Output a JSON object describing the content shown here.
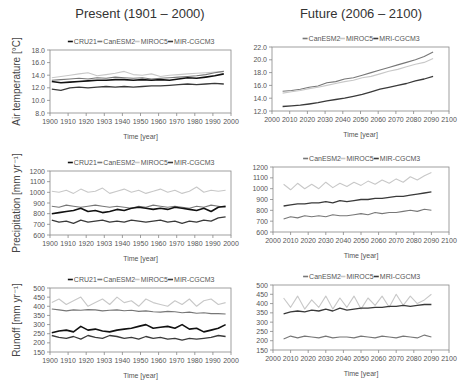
{
  "columns": {
    "left_title": "Present (1901 – 2000)",
    "right_title": "Future (2006 – 2100)"
  },
  "series_styles": {
    "CRU21": {
      "color": "#111111",
      "width": 1.6
    },
    "CanESM2": {
      "color": "#777777",
      "width": 1.1
    },
    "MIROC5": {
      "color": "#c8c8c8",
      "width": 1.1
    },
    "MIR-CGCM3": {
      "color": "#3a3a3a",
      "width": 1.3
    },
    "MRI-CGCM3": {
      "color": "#3a3a3a",
      "width": 1.3
    }
  },
  "chart_data": [
    {
      "id": "temp-present",
      "type": "line",
      "title": "",
      "ylabel": "Air temperature [°C]",
      "xlabel": "Time [year]",
      "box": {
        "x0": 50,
        "x1": 231,
        "y0": 50,
        "y1": 113
      },
      "xlim": [
        1900,
        2000
      ],
      "ylim": [
        8,
        18
      ],
      "xticks": [
        1900,
        1910,
        1920,
        1930,
        1940,
        1950,
        1960,
        1970,
        1980,
        1990,
        2000
      ],
      "xtick_labels": [
        "1900",
        "1910",
        "1920",
        "1903",
        "1940",
        "1950",
        "1960",
        "1970",
        "1980",
        "1990",
        "2000"
      ],
      "yticks": [
        8,
        10,
        12,
        14,
        16,
        18
      ],
      "ytick_labels": [
        "8.0",
        "10.0",
        "12.0",
        "14.0",
        "16.0",
        "18.0"
      ],
      "legend": [
        "CRU21",
        "CanESM2",
        "MIROC5",
        "MIR-CGCM3"
      ],
      "series": [
        {
          "name": "MIROC5",
          "x_start": 1901,
          "x_step": 5,
          "values": [
            13.6,
            13.8,
            14.0,
            14.2,
            14.4,
            13.9,
            14.1,
            14.3,
            14.6,
            14.1,
            14.0,
            14.2,
            13.8,
            14.0,
            14.1,
            14.2,
            14.3,
            14.4,
            14.5,
            14.6
          ]
        },
        {
          "name": "CanESM2",
          "x_start": 1901,
          "x_step": 5,
          "values": [
            13.2,
            13.3,
            13.4,
            13.5,
            13.4,
            13.6,
            13.5,
            13.7,
            13.6,
            13.5,
            13.6,
            13.4,
            13.5,
            13.6,
            13.7,
            13.8,
            13.9,
            14.1,
            14.4,
            14.6
          ]
        },
        {
          "name": "CRU21",
          "x_start": 1901,
          "x_step": 5,
          "values": [
            13.0,
            12.8,
            12.9,
            13.0,
            13.1,
            13.2,
            13.2,
            13.3,
            13.3,
            13.2,
            13.3,
            13.2,
            13.3,
            13.2,
            13.4,
            13.6,
            13.5,
            13.7,
            13.9,
            14.2
          ]
        },
        {
          "name": "MIR-CGCM3",
          "x_start": 1901,
          "x_step": 5,
          "values": [
            11.8,
            11.6,
            12.0,
            12.1,
            12.0,
            12.1,
            12.2,
            12.1,
            12.2,
            12.1,
            12.2,
            12.3,
            12.3,
            12.4,
            12.5,
            12.6,
            12.5,
            12.6,
            12.7,
            12.6
          ]
        }
      ]
    },
    {
      "id": "temp-future",
      "type": "line",
      "title": "",
      "ylabel": "",
      "xlabel": "Time [year]",
      "box": {
        "x0": 272,
        "x1": 449,
        "y0": 47,
        "y1": 111
      },
      "xlim": [
        2000,
        2100
      ],
      "ylim": [
        12,
        22
      ],
      "xticks": [
        2000,
        2010,
        2020,
        2030,
        2040,
        2050,
        2060,
        2070,
        2080,
        2090,
        2100
      ],
      "xtick_labels": [
        "2000",
        "2010",
        "2020",
        "2030",
        "2040",
        "2050",
        "2060",
        "2070",
        "2080",
        "2090",
        "2100"
      ],
      "yticks": [
        12,
        14,
        16,
        18,
        20,
        22
      ],
      "ytick_labels": [
        "12.0",
        "14.0",
        "16.0",
        "18.0",
        "20.0",
        "22.0"
      ],
      "legend": [
        "CanESM2",
        "MIROC5",
        "MRI-CGCM3"
      ],
      "series": [
        {
          "name": "CanESM2",
          "x_start": 2006,
          "x_step": 5,
          "values": [
            15.1,
            15.2,
            15.4,
            15.7,
            15.9,
            16.4,
            16.6,
            17.0,
            17.2,
            17.6,
            18.0,
            18.4,
            18.8,
            19.2,
            19.6,
            20.0,
            20.5,
            21.2
          ]
        },
        {
          "name": "MIROC5",
          "x_start": 2006,
          "x_step": 5,
          "values": [
            14.8,
            15.0,
            15.2,
            15.5,
            15.7,
            16.0,
            16.3,
            16.6,
            16.8,
            17.2,
            17.4,
            17.8,
            18.2,
            18.5,
            18.9,
            19.3,
            19.6,
            20.2
          ]
        },
        {
          "name": "MRI-CGCM3",
          "x_start": 2006,
          "x_step": 5,
          "values": [
            12.7,
            12.8,
            12.9,
            13.1,
            13.3,
            13.6,
            13.8,
            14.0,
            14.3,
            14.6,
            15.0,
            15.4,
            15.7,
            16.0,
            16.3,
            16.7,
            17.0,
            17.4
          ]
        }
      ]
    },
    {
      "id": "precip-present",
      "type": "line",
      "title": "",
      "ylabel": "Precipitation [mm yr⁻¹]",
      "xlabel": "Time [year]",
      "box": {
        "x0": 50,
        "x1": 231,
        "y0": 171,
        "y1": 235
      },
      "xlim": [
        1900,
        2000
      ],
      "ylim": [
        600,
        1200
      ],
      "xticks": [
        1900,
        1910,
        1920,
        1930,
        1940,
        1950,
        1960,
        1970,
        1980,
        1990,
        2000
      ],
      "xtick_labels": [
        "1900",
        "1910",
        "1920",
        "1903",
        "1940",
        "1950",
        "1960",
        "1970",
        "1980",
        "1990",
        "2000"
      ],
      "yticks": [
        600,
        700,
        800,
        900,
        1000,
        1100,
        1200
      ],
      "ytick_labels": [
        "600",
        "700",
        "800",
        "900",
        "1000",
        "1100",
        "1200"
      ],
      "legend": [
        "CRU21",
        "CanESM2",
        "MIROC5",
        "MIR-CGCM3"
      ],
      "series": [
        {
          "name": "MIROC5",
          "x_start": 1901,
          "x_step": 4,
          "values": [
            1010,
            1000,
            1020,
            990,
            1030,
            1000,
            1010,
            1040,
            990,
            1010,
            1030,
            1000,
            1020,
            990,
            1010,
            1030,
            1000,
            1020,
            990,
            1010,
            1050,
            1000,
            1020,
            1010,
            1020
          ]
        },
        {
          "name": "CanESM2",
          "x_start": 1901,
          "x_step": 4,
          "values": [
            870,
            860,
            880,
            870,
            860,
            870,
            880,
            870,
            860,
            870,
            860,
            850,
            870,
            860,
            880,
            870,
            860,
            870,
            860,
            850,
            870,
            860,
            880,
            870,
            860
          ]
        },
        {
          "name": "CRU21",
          "x_start": 1901,
          "x_step": 4,
          "values": [
            800,
            810,
            820,
            830,
            850,
            820,
            830,
            810,
            820,
            840,
            830,
            850,
            860,
            850,
            840,
            850,
            840,
            860,
            850,
            840,
            830,
            850,
            820,
            860,
            870
          ]
        },
        {
          "name": "MIR-CGCM3",
          "x_start": 1901,
          "x_step": 4,
          "values": [
            740,
            720,
            730,
            710,
            740,
            720,
            730,
            740,
            720,
            730,
            720,
            740,
            730,
            720,
            730,
            740,
            720,
            730,
            710,
            730,
            720,
            740,
            730,
            760,
            770
          ]
        }
      ]
    },
    {
      "id": "precip-future",
      "type": "line",
      "title": "",
      "ylabel": "",
      "xlabel": "Time [year]",
      "box": {
        "x0": 273,
        "x1": 449,
        "y0": 167,
        "y1": 232
      },
      "xlim": [
        2000,
        2100
      ],
      "ylim": [
        600,
        1200
      ],
      "xticks": [
        2000,
        2010,
        2020,
        2030,
        2040,
        2050,
        2060,
        2070,
        2080,
        2090,
        2100
      ],
      "xtick_labels": [
        "2000",
        "2010",
        "2020",
        "2030",
        "2040",
        "2050",
        "2060",
        "2070",
        "2080",
        "2090",
        "2100"
      ],
      "yticks": [
        600,
        700,
        800,
        900,
        1000,
        1100,
        1200
      ],
      "ytick_labels": [
        "600",
        "700",
        "800",
        "900",
        "1000",
        "1100",
        "1200"
      ],
      "legend": [
        "CanESM2",
        "MIROC5",
        "MIR-CGCM3"
      ],
      "series": [
        {
          "name": "MIROC5",
          "x_start": 2006,
          "x_step": 4,
          "values": [
            1040,
            990,
            1050,
            1000,
            1040,
            1000,
            1060,
            1010,
            1050,
            1020,
            1060,
            1030,
            1070,
            1040,
            1080,
            1050,
            1090,
            1060,
            1110,
            1080,
            1120,
            1150
          ]
        },
        {
          "name": "MRI-CGCM3",
          "x_start": 2006,
          "x_step": 4,
          "values": [
            840,
            850,
            860,
            860,
            870,
            870,
            880,
            870,
            890,
            880,
            890,
            900,
            900,
            910,
            910,
            920,
            930,
            930,
            940,
            950,
            960,
            970
          ]
        },
        {
          "name": "CanESM2",
          "x_start": 2006,
          "x_step": 4,
          "values": [
            720,
            740,
            730,
            750,
            740,
            750,
            740,
            760,
            750,
            750,
            760,
            770,
            760,
            780,
            770,
            780,
            780,
            790,
            800,
            790,
            810,
            800
          ]
        }
      ]
    },
    {
      "id": "runoff-present",
      "type": "line",
      "title": "",
      "ylabel": "Runoff [mm yr⁻¹]",
      "xlabel": "Time [year]",
      "box": {
        "x0": 50,
        "x1": 231,
        "y0": 288,
        "y1": 352
      },
      "xlim": [
        1900,
        2000
      ],
      "ylim": [
        150,
        500
      ],
      "xticks": [
        1900,
        1910,
        1920,
        1930,
        1940,
        1950,
        1960,
        1970,
        1980,
        1990,
        2000
      ],
      "xtick_labels": [
        "1900",
        "1910",
        "1920",
        "1903",
        "1940",
        "1950",
        "1960",
        "1970",
        "1980",
        "1990",
        "2000"
      ],
      "yticks": [
        150,
        200,
        250,
        300,
        350,
        400,
        450,
        500
      ],
      "ytick_labels": [
        "150",
        "200",
        "250",
        "300",
        "350",
        "400",
        "450",
        "500"
      ],
      "legend": [
        "CRU21",
        "CanESM2",
        "MIROC5",
        "MIR-CGCM3"
      ],
      "series": [
        {
          "name": "MIROC5",
          "x_start": 1901,
          "x_step": 4,
          "values": [
            420,
            440,
            410,
            430,
            450,
            400,
            420,
            440,
            410,
            450,
            420,
            430,
            400,
            440,
            420,
            410,
            400,
            430,
            410,
            440,
            400,
            430,
            440,
            410,
            420
          ]
        },
        {
          "name": "CanESM2",
          "x_start": 1901,
          "x_step": 4,
          "values": [
            385,
            380,
            375,
            380,
            378,
            382,
            380,
            375,
            378,
            380,
            376,
            378,
            372,
            375,
            370,
            368,
            372,
            370,
            365,
            368,
            362,
            365,
            360,
            360,
            358
          ]
        },
        {
          "name": "CRU21",
          "x_start": 1901,
          "x_step": 4,
          "values": [
            255,
            265,
            270,
            260,
            290,
            270,
            275,
            265,
            260,
            270,
            275,
            280,
            290,
            300,
            280,
            285,
            290,
            280,
            300,
            275,
            280,
            260,
            270,
            280,
            300
          ]
        },
        {
          "name": "MIR-CGCM3",
          "x_start": 1901,
          "x_step": 4,
          "values": [
            240,
            230,
            225,
            235,
            220,
            240,
            230,
            225,
            240,
            235,
            225,
            230,
            220,
            235,
            225,
            230,
            220,
            225,
            215,
            225,
            220,
            225,
            230,
            240,
            235
          ]
        }
      ]
    },
    {
      "id": "runoff-future",
      "type": "line",
      "title": "",
      "ylabel": "",
      "xlabel": "Time [year]",
      "box": {
        "x0": 273,
        "x1": 449,
        "y0": 285,
        "y1": 350
      },
      "xlim": [
        2000,
        2100
      ],
      "ylim": [
        150,
        500
      ],
      "xticks": [
        2000,
        2010,
        2020,
        2030,
        2040,
        2050,
        2060,
        2070,
        2080,
        2090,
        2100
      ],
      "xtick_labels": [
        "2000",
        "2010",
        "2020",
        "2030",
        "2040",
        "2050",
        "2060",
        "2070",
        "2080",
        "2090",
        "2100"
      ],
      "yticks": [
        150,
        200,
        250,
        300,
        350,
        400,
        450,
        500
      ],
      "ytick_labels": [
        "150",
        "200",
        "250",
        "300",
        "350",
        "400",
        "450",
        "500"
      ],
      "legend": [
        "CanESM2",
        "MIROC5",
        "MRI-CGCM3"
      ],
      "series": [
        {
          "name": "MIROC5",
          "x_start": 2006,
          "x_step": 4,
          "values": [
            430,
            380,
            440,
            370,
            420,
            380,
            440,
            370,
            430,
            380,
            440,
            370,
            430,
            390,
            440,
            380,
            450,
            390,
            440,
            400,
            420,
            450
          ]
        },
        {
          "name": "MRI-CGCM3",
          "x_start": 2006,
          "x_step": 4,
          "values": [
            345,
            355,
            360,
            355,
            365,
            360,
            370,
            360,
            375,
            365,
            370,
            375,
            375,
            380,
            380,
            385,
            385,
            390,
            385,
            390,
            395,
            395
          ]
        },
        {
          "name": "CanESM2",
          "x_start": 2006,
          "x_step": 4,
          "values": [
            210,
            225,
            215,
            225,
            220,
            215,
            225,
            215,
            220,
            220,
            215,
            225,
            220,
            215,
            225,
            220,
            215,
            225,
            220,
            215,
            230,
            220
          ]
        }
      ]
    }
  ]
}
